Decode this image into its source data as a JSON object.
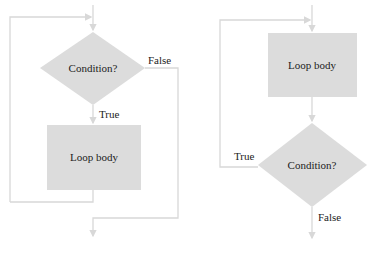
{
  "diagrams": [
    {
      "name": "while-loop",
      "decision": "Condition?",
      "process": "Loop body",
      "true_label": "True",
      "false_label": "False"
    },
    {
      "name": "do-while-loop",
      "decision": "Condition?",
      "process": "Loop body",
      "true_label": "True",
      "false_label": "False"
    }
  ],
  "colors": {
    "shape_fill": "#dcdcdc",
    "line": "#d8d8d8",
    "text": "#222222"
  }
}
